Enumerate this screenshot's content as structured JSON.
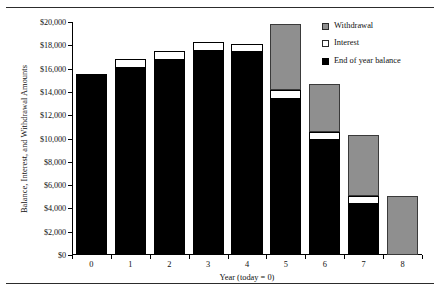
{
  "figure": {
    "rules": [
      "top-rule",
      "bottom-rule"
    ]
  },
  "chart_data": {
    "type": "bar",
    "stacked": true,
    "title": "",
    "xlabel": "Year (today = 0)",
    "ylabel": "Balance, Interest, and Withdrawal Amounts",
    "categories": [
      "0",
      "1",
      "2",
      "3",
      "4",
      "5",
      "6",
      "7",
      "8"
    ],
    "ylim": [
      0,
      20000
    ],
    "ytick_step": 2000,
    "yticks": [
      0,
      2000,
      4000,
      6000,
      8000,
      10000,
      12000,
      14000,
      16000,
      18000,
      20000
    ],
    "ytick_labels": [
      "$0",
      "$2,000",
      "$4,000",
      "$6,000",
      "$8,000",
      "$10,000",
      "$12,000",
      "$14,000",
      "$16,000",
      "$18,000",
      "$20,000"
    ],
    "grid": false,
    "legend_position": "top-right",
    "series": [
      {
        "name": "End of year balance",
        "color": "#000000",
        "values": [
          15500,
          16050,
          16750,
          17500,
          17450,
          13400,
          9900,
          4400,
          0
        ]
      },
      {
        "name": "Interest",
        "color": "#ffffff",
        "values": [
          0,
          800,
          800,
          750,
          700,
          800,
          700,
          700,
          0
        ]
      },
      {
        "name": "Withdrawal",
        "color": "#8f8f8f",
        "values": [
          0,
          0,
          0,
          0,
          0,
          5600,
          4100,
          5200,
          5100
        ]
      }
    ],
    "stack_order": [
      "End of year balance",
      "Interest",
      "Withdrawal"
    ],
    "totals": [
      15500,
      16850,
      17550,
      18250,
      18150,
      19800,
      14700,
      10300,
      5100
    ]
  },
  "legend": {
    "items": [
      {
        "label": "Withdrawal",
        "swatch": "withdrawal-swatch"
      },
      {
        "label": "Interest",
        "swatch": "interest-swatch"
      },
      {
        "label": "End of year balance",
        "swatch": "balance-swatch"
      }
    ]
  }
}
